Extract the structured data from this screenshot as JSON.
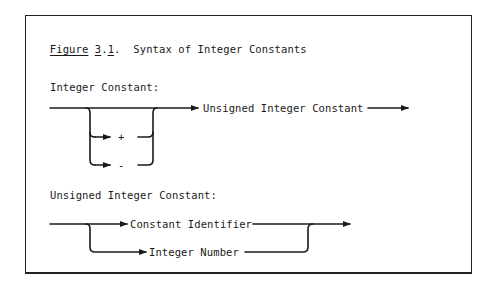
{
  "figure": {
    "label": "Figure",
    "number_major": "3",
    "number_minor": "1",
    "title": "Syntax of Integer Constants"
  },
  "diagrams": [
    {
      "heading": "Integer Constant:",
      "optional_signs": [
        "+",
        "-"
      ],
      "target": "Unsigned Integer Constant"
    },
    {
      "heading": "Unsigned Integer Constant:",
      "alternatives": [
        "Constant Identifier",
        "Integer Number"
      ]
    }
  ]
}
